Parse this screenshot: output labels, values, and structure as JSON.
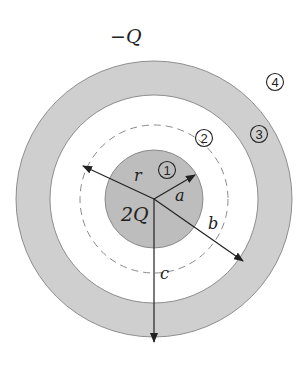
{
  "diagram": {
    "colors": {
      "shell_fill": "#cfcfcf",
      "core_fill": "#bdbdbd",
      "stroke": "#555555",
      "dashed": "#8a8a8a",
      "arrow": "#222222"
    },
    "labels": {
      "shell_charge": "−Q",
      "core_charge": "2Q",
      "radius_r": "r",
      "radius_a": "a",
      "radius_b": "b",
      "radius_c": "c"
    },
    "regions": [
      {
        "id": "region-1",
        "label": "1"
      },
      {
        "id": "region-2",
        "label": "2"
      },
      {
        "id": "region-3",
        "label": "3"
      },
      {
        "id": "region-4",
        "label": "4"
      }
    ]
  }
}
